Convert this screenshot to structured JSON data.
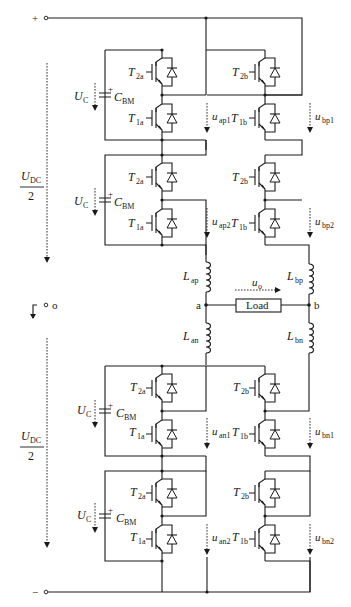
{
  "diagram": {
    "terminals": {
      "positive": "+",
      "negative": "−",
      "midpoint": "o"
    },
    "dc_link": {
      "upper_label_num": "U",
      "upper_label_sub": "DC",
      "upper_label_den": "2",
      "lower_label_num": "U",
      "lower_label_sub": "DC",
      "lower_label_den": "2"
    },
    "submodule_labels": {
      "capacitor_voltage": "U",
      "capacitor_voltage_sub": "C",
      "capacitor": "C",
      "capacitor_sub": "BM",
      "plus_sign": "+",
      "t2a": "T",
      "t2a_sub": "2a",
      "t1a": "T",
      "t1a_sub": "1a",
      "t2b": "T",
      "t2b_sub": "2b",
      "t1b": "T",
      "t1b_sub": "1b"
    },
    "arm_voltages": [
      {
        "main": "u",
        "sub": "ap1"
      },
      {
        "main": "u",
        "sub": "bp1"
      },
      {
        "main": "u",
        "sub": "ap2"
      },
      {
        "main": "u",
        "sub": "bp2"
      },
      {
        "main": "u",
        "sub": "an1"
      },
      {
        "main": "u",
        "sub": "bn1"
      },
      {
        "main": "u",
        "sub": "an2"
      },
      {
        "main": "u",
        "sub": "bn2"
      }
    ],
    "inductors": {
      "lap": {
        "main": "L",
        "sub": "ap"
      },
      "lbp": {
        "main": "L",
        "sub": "bp"
      },
      "lan": {
        "main": "L",
        "sub": "an"
      },
      "lbn": {
        "main": "L",
        "sub": "bn"
      }
    },
    "nodes": {
      "a": "a",
      "b": "b"
    },
    "load": {
      "label": "Load",
      "output_voltage_main": "u",
      "output_voltage_sub": "o"
    },
    "colors": {
      "line": "#1a1a1a",
      "background": "#ffffff"
    }
  }
}
